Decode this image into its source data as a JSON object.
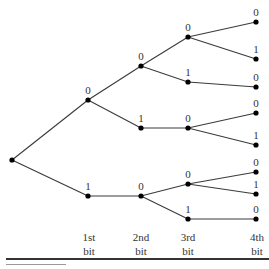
{
  "diagram": {
    "root": {
      "id": "root"
    },
    "nodes": [
      {
        "id": "b1-0",
        "parent": "root",
        "bit": "0",
        "level": 1
      },
      {
        "id": "b1-1",
        "parent": "root",
        "bit": "1",
        "level": 1
      },
      {
        "id": "b2-00",
        "parent": "b1-0",
        "bit": "0",
        "level": 2
      },
      {
        "id": "b2-01",
        "parent": "b1-0",
        "bit": "1",
        "level": 2
      },
      {
        "id": "b2-10",
        "parent": "b1-1",
        "bit": "0",
        "level": 2
      },
      {
        "id": "b3-000",
        "parent": "b2-00",
        "bit": "0",
        "level": 3
      },
      {
        "id": "b3-001",
        "parent": "b2-00",
        "bit": "1",
        "level": 3
      },
      {
        "id": "b3-010",
        "parent": "b2-01",
        "bit": "0",
        "level": 3
      },
      {
        "id": "b3-100",
        "parent": "b2-10",
        "bit": "0",
        "level": 3
      },
      {
        "id": "b3-101",
        "parent": "b2-10",
        "bit": "1",
        "level": 3
      },
      {
        "id": "b4-0000",
        "parent": "b3-000",
        "bit": "0",
        "level": 4
      },
      {
        "id": "b4-0001",
        "parent": "b3-000",
        "bit": "1",
        "level": 4
      },
      {
        "id": "b4-0010",
        "parent": "b3-001",
        "bit": "0",
        "level": 4
      },
      {
        "id": "b4-0100",
        "parent": "b3-010",
        "bit": "0",
        "level": 4
      },
      {
        "id": "b4-0101",
        "parent": "b3-010",
        "bit": "1",
        "level": 4
      },
      {
        "id": "b4-1000",
        "parent": "b3-100",
        "bit": "0",
        "level": 4
      },
      {
        "id": "b4-1001",
        "parent": "b3-100",
        "bit": "1",
        "level": 4
      },
      {
        "id": "b4-1010",
        "parent": "b3-101",
        "bit": "0",
        "level": 4
      }
    ],
    "columns": [
      {
        "line1": "1st",
        "line2": "bit"
      },
      {
        "line1": "2nd",
        "line2": "bit"
      },
      {
        "line1": "3rd",
        "line2": "bit"
      },
      {
        "line1": "4th",
        "line2": "bit"
      }
    ]
  }
}
